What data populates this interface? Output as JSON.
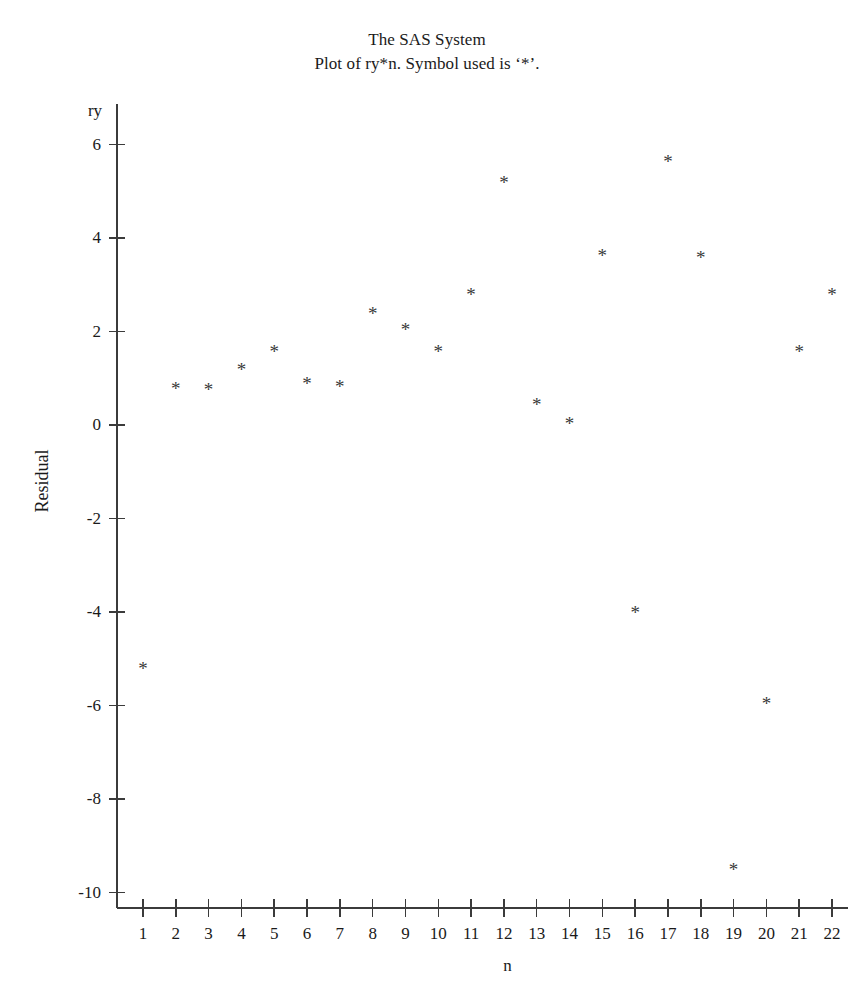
{
  "titles": {
    "line1": "The SAS System",
    "line2": "Plot of ry*n. Symbol used is ‘*’."
  },
  "axes": {
    "y_variable_label": "ry",
    "y_axis_title": "Residual",
    "x_axis_title": "n",
    "y_ticks": [
      "6",
      "4",
      "2",
      "0",
      "-2",
      "-4",
      "-6",
      "-8",
      "-10"
    ],
    "x_ticks": [
      "1",
      "2",
      "3",
      "4",
      "5",
      "6",
      "7",
      "8",
      "9",
      "10",
      "11",
      "12",
      "13",
      "14",
      "15",
      "16",
      "17",
      "18",
      "19",
      "20",
      "21",
      "22"
    ]
  },
  "style": {
    "axis_color": "#3b3b3b",
    "marker_color": "#3a3a3a",
    "text_color": "#1a1a1a",
    "background": "#ffffff",
    "marker_glyph": "*"
  },
  "chart_data": {
    "type": "scatter",
    "title": "The SAS System",
    "subtitle": "Plot of ry*n. Symbol used is ‘*’.",
    "xlabel": "n",
    "ylabel": "Residual",
    "y_variable": "ry",
    "symbol": "*",
    "grid": false,
    "legend": "none",
    "xlim": [
      0.3,
      22.7
    ],
    "ylim": [
      -10.9,
      6.9
    ],
    "xticks": [
      1,
      2,
      3,
      4,
      5,
      6,
      7,
      8,
      9,
      10,
      11,
      12,
      13,
      14,
      15,
      16,
      17,
      18,
      19,
      20,
      21,
      22
    ],
    "yticks": [
      6,
      4,
      2,
      0,
      -2,
      -4,
      -6,
      -8,
      -10
    ],
    "x": [
      1,
      2,
      3,
      4,
      5,
      6,
      7,
      8,
      9,
      10,
      11,
      12,
      13,
      14,
      15,
      16,
      17,
      18,
      19,
      20,
      21,
      22
    ],
    "y": [
      -5.1,
      0.9,
      0.88,
      1.3,
      1.7,
      1.0,
      0.95,
      2.5,
      2.15,
      1.7,
      2.9,
      5.3,
      0.55,
      0.15,
      3.75,
      -3.9,
      5.75,
      3.7,
      -9.4,
      -5.85,
      1.7,
      2.9
    ],
    "points": [
      {
        "n": 1,
        "ry": -5.1
      },
      {
        "n": 2,
        "ry": 0.9
      },
      {
        "n": 3,
        "ry": 0.88
      },
      {
        "n": 4,
        "ry": 1.3
      },
      {
        "n": 5,
        "ry": 1.7
      },
      {
        "n": 6,
        "ry": 1.0
      },
      {
        "n": 7,
        "ry": 0.95
      },
      {
        "n": 8,
        "ry": 2.5
      },
      {
        "n": 9,
        "ry": 2.15
      },
      {
        "n": 10,
        "ry": 1.7
      },
      {
        "n": 11,
        "ry": 2.9
      },
      {
        "n": 12,
        "ry": 5.3
      },
      {
        "n": 13,
        "ry": 0.55
      },
      {
        "n": 14,
        "ry": 0.15
      },
      {
        "n": 15,
        "ry": 3.75
      },
      {
        "n": 16,
        "ry": -3.9
      },
      {
        "n": 17,
        "ry": 5.75
      },
      {
        "n": 18,
        "ry": 3.7
      },
      {
        "n": 19,
        "ry": -9.4
      },
      {
        "n": 20,
        "ry": -5.85
      },
      {
        "n": 21,
        "ry": 1.7
      },
      {
        "n": 22,
        "ry": 2.9
      }
    ]
  },
  "geometry": {
    "x_axis_px": {
      "start": 117,
      "end": 848,
      "y": 908
    },
    "y_axis_px": {
      "x": 117,
      "top": 104,
      "bottom": 908
    },
    "x_tick1_px": 143,
    "x_tick_step_px": 32.81,
    "y_zero_px": 425,
    "y_unit_px": 46.75
  }
}
